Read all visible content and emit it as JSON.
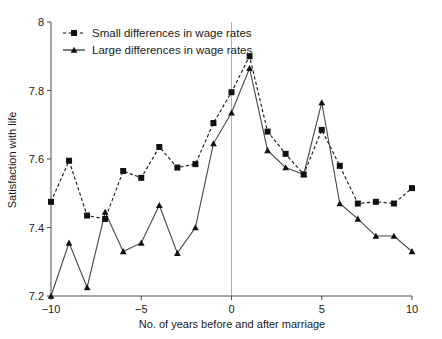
{
  "chart_data": {
    "type": "line",
    "title": "",
    "subtitle": "",
    "xlabel": "No. of years before and after marriage",
    "ylabel": "Satisfaction with life",
    "xlim": [
      -10,
      10
    ],
    "ylim": [
      7.2,
      8
    ],
    "grid": false,
    "legend_position": "top-left",
    "x_ticks": [
      -10,
      -5,
      0,
      5,
      10
    ],
    "x_tick_labels": [
      "−10",
      "−5",
      "0",
      "5",
      "10"
    ],
    "y_ticks": [
      7.2,
      7.4,
      7.6,
      7.8,
      8
    ],
    "y_tick_labels": [
      "7.2",
      "7.4",
      "7.6",
      "7.8",
      "8"
    ],
    "annotations": [
      {
        "name": "marriage-reference-line",
        "type": "vline",
        "x": 0
      }
    ],
    "x": [
      -10,
      -9,
      -8,
      -7,
      -6,
      -5,
      -4,
      -3,
      -2,
      -1,
      0,
      1,
      2,
      3,
      4,
      5,
      6,
      7,
      8,
      9,
      10
    ],
    "series": [
      {
        "name": "Small differences in wage rates",
        "marker": "square",
        "linestyle": "dashed",
        "color": "#111111",
        "values": [
          7.475,
          7.595,
          7.435,
          7.425,
          7.565,
          7.545,
          7.635,
          7.575,
          7.585,
          7.705,
          7.795,
          7.9,
          7.68,
          7.615,
          7.555,
          7.685,
          7.58,
          7.47,
          7.475,
          7.47,
          7.515
        ]
      },
      {
        "name": "Large differences in wage rates",
        "marker": "triangle",
        "linestyle": "solid",
        "color": "#444444",
        "values": [
          7.2,
          7.355,
          7.225,
          7.445,
          7.33,
          7.355,
          7.465,
          7.325,
          7.4,
          7.645,
          7.735,
          7.865,
          7.625,
          7.575,
          7.555,
          7.765,
          7.47,
          7.425,
          7.375,
          7.375,
          7.33
        ]
      }
    ]
  },
  "legend": {
    "entries": [
      {
        "label": "Small differences in wage rates",
        "marker": "square",
        "linestyle": "dashed"
      },
      {
        "label": "Large differences in wage rates",
        "marker": "triangle",
        "linestyle": "solid"
      }
    ]
  },
  "axes": {
    "y_title": "Satisfaction with life",
    "x_title": "No. of years before and after marriage"
  }
}
